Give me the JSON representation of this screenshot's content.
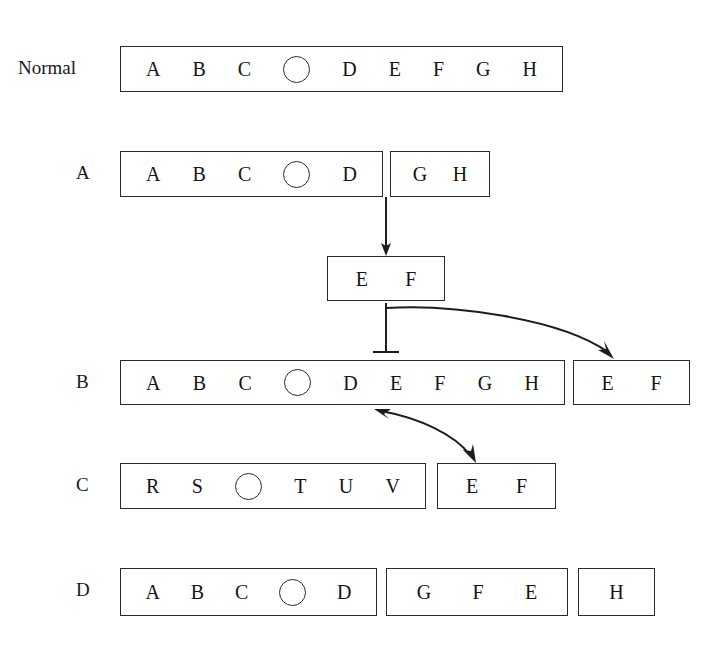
{
  "figure": {
    "stroke_color": "#1d1d1d",
    "background": "#ffffff",
    "centromere_symbol": "open-circle"
  },
  "rows": [
    {
      "id": "normal",
      "label": "Normal",
      "label_x": 18,
      "label_y": 58,
      "segments": [
        {
          "name": "normal-chromosome",
          "x": 120,
          "y": 46,
          "w": 443,
          "h": 46,
          "items": [
            "A",
            "B",
            "C",
            "centromere",
            "D",
            "E",
            "F",
            "G",
            "H"
          ]
        }
      ]
    },
    {
      "id": "a",
      "label": "A",
      "label_x": 76,
      "label_y": 163,
      "segments": [
        {
          "name": "row-a-left-fragment",
          "x": 120,
          "y": 151,
          "w": 263,
          "h": 46,
          "items": [
            "A",
            "B",
            "C",
            "centromere",
            "D"
          ]
        },
        {
          "name": "row-a-right-fragment",
          "x": 390,
          "y": 151,
          "w": 100,
          "h": 46,
          "items": [
            "G",
            "H"
          ]
        }
      ]
    },
    {
      "id": "ef-deleted",
      "label": "",
      "segments": [
        {
          "name": "deleted-ef-fragment",
          "x": 327,
          "y": 256,
          "w": 118,
          "h": 45,
          "items": [
            "E",
            "F"
          ]
        }
      ]
    },
    {
      "id": "b",
      "label": "B",
      "label_x": 76,
      "label_y": 372,
      "segments": [
        {
          "name": "row-b-chromosome",
          "x": 120,
          "y": 360,
          "w": 445,
          "h": 45,
          "items": [
            "A",
            "B",
            "C",
            "centromere",
            "D",
            "E",
            "F",
            "G",
            "H"
          ]
        },
        {
          "name": "row-b-ef-fragment",
          "x": 573,
          "y": 360,
          "w": 117,
          "h": 45,
          "items": [
            "E",
            "F"
          ]
        }
      ]
    },
    {
      "id": "c",
      "label": "C",
      "label_x": 76,
      "label_y": 475,
      "segments": [
        {
          "name": "row-c-chromosome",
          "x": 120,
          "y": 463,
          "w": 306,
          "h": 46,
          "items": [
            "R",
            "S",
            "centromere",
            "T",
            "U",
            "V"
          ]
        },
        {
          "name": "row-c-ef-fragment",
          "x": 437,
          "y": 463,
          "w": 119,
          "h": 46,
          "items": [
            "E",
            "F"
          ]
        }
      ]
    },
    {
      "id": "d",
      "label": "D",
      "label_x": 76,
      "label_y": 580,
      "segments": [
        {
          "name": "row-d-left-fragment",
          "x": 120,
          "y": 568,
          "w": 257,
          "h": 48,
          "items": [
            "A",
            "B",
            "C",
            "centromere",
            "D"
          ]
        },
        {
          "name": "row-d-middle-fragment",
          "x": 386,
          "y": 568,
          "w": 182,
          "h": 48,
          "items": [
            "G",
            "F",
            "E"
          ]
        },
        {
          "name": "row-d-right-fragment",
          "x": 578,
          "y": 568,
          "w": 77,
          "h": 48,
          "items": [
            "H"
          ]
        }
      ]
    }
  ],
  "connectors": [
    {
      "name": "excision-arrow-down",
      "kind": "straight-arrow",
      "from": [
        386,
        198
      ],
      "to": [
        386,
        254
      ]
    },
    {
      "name": "reinsertion-blocked-line",
      "kind": "blunt-end-line",
      "from": [
        386,
        302
      ],
      "to": [
        386,
        352
      ]
    },
    {
      "name": "fragment-to-row-b-curve",
      "kind": "curved-arrow",
      "from": [
        386,
        308
      ],
      "to": [
        612,
        357
      ]
    },
    {
      "name": "row-b-to-row-c-curve",
      "kind": "curved-double-arrow",
      "from": [
        376,
        410
      ],
      "to": [
        476,
        460
      ]
    }
  ]
}
